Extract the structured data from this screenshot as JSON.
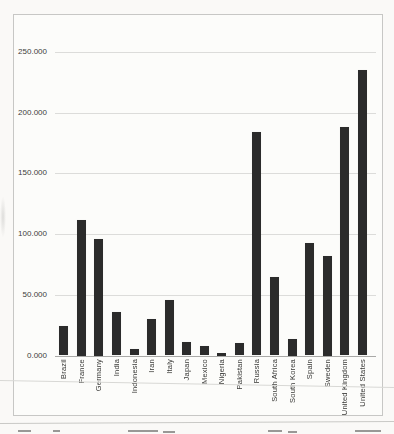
{
  "canvas": {
    "width": 394,
    "height": 434
  },
  "colors": {
    "paper": "#faf9f7",
    "bar": "#2b2b2b",
    "gridline": "#dcdcda",
    "axis_line": "#a9a9a7",
    "frame_border": "#c7c7c5",
    "tick_text": "#3d3d3b"
  },
  "chart_data": {
    "type": "bar",
    "title": "",
    "xlabel": "",
    "ylabel": "",
    "categories": [
      "Brazil",
      "France",
      "Germany",
      "India",
      "Indonesia",
      "Iran",
      "Italy",
      "Japan",
      "Mexico",
      "Nigeria",
      "Pakistan",
      "Russia",
      "South Africa",
      "South Korea",
      "Spain",
      "Sweden",
      "United Kingdom",
      "United States"
    ],
    "values": [
      24000,
      112000,
      96000,
      36000,
      5500,
      30000,
      46000,
      11000,
      7500,
      2500,
      10500,
      184000,
      65000,
      14000,
      93000,
      82000,
      188000,
      235000
    ],
    "ylim": [
      0,
      250000
    ],
    "y_tick_interval": 50000,
    "y_tick_labels": [
      "0.000",
      "50.000",
      "100.000",
      "150.000",
      "200.000",
      "250.000"
    ],
    "grid": true,
    "legend": false
  }
}
